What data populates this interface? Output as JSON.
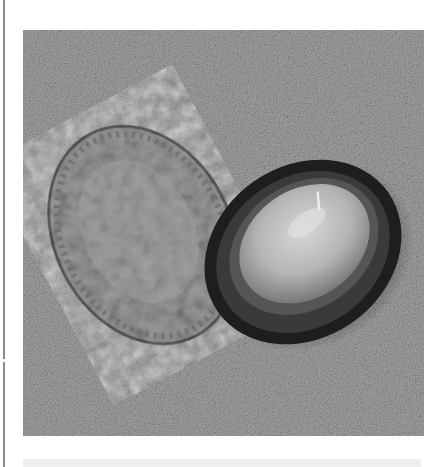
{
  "page": {
    "type": "printed-page-scan",
    "left_rule": true
  },
  "figure": {
    "alt": "Grayscale photograph of two limpet shells lying on sand: left shell shows its ridged exterior, right shell shows its glossy interior with a dark rim",
    "subjects": [
      {
        "name": "limpet-shell-exterior",
        "view": "exterior, ribbed edge"
      },
      {
        "name": "limpet-shell-interior",
        "view": "interior, glossy pale center with dark margin"
      }
    ],
    "background": "sand",
    "colors": {
      "sand": "#8f8f8f",
      "shell_exterior": "#9a9a9a",
      "shell_interior_rim": "#1e1e1e",
      "shell_interior_center": "#bdbdbd",
      "page_rule": "#8a8a8a",
      "page_background": "#ffffff"
    }
  }
}
